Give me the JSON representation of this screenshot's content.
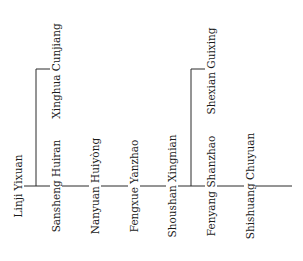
{
  "diagram": {
    "type": "lineage-tree",
    "line_color": "#2b2b2b",
    "text_color": "#1a1a1a",
    "nodes": [
      {
        "id": "linji",
        "label": "Linji Yixuan",
        "role": "root"
      },
      {
        "id": "xinghua",
        "label": "Xinghua Cunjiang",
        "role": "branch"
      },
      {
        "id": "sansheng",
        "label": "Sansheng Huiran",
        "role": "trunk"
      },
      {
        "id": "nanyuan",
        "label": "Nanyuan Huiyòng",
        "role": "trunk"
      },
      {
        "id": "fengxue",
        "label": "Fengxue Yanzhao",
        "role": "trunk"
      },
      {
        "id": "shoushan",
        "label": "Shoushan Xingnian",
        "role": "trunk"
      },
      {
        "id": "shexian",
        "label": "Shexian Guixing",
        "role": "branch"
      },
      {
        "id": "fenyang",
        "label": "Fenyang Shanzhao",
        "role": "trunk"
      },
      {
        "id": "shishuang",
        "label": "Shishuang Chuyuan",
        "role": "trunk"
      }
    ],
    "edges": [
      {
        "from": "linji",
        "to": "xinghua"
      },
      {
        "from": "linji",
        "to": "sansheng"
      },
      {
        "from": "sansheng",
        "to": "nanyuan"
      },
      {
        "from": "nanyuan",
        "to": "fengxue"
      },
      {
        "from": "fengxue",
        "to": "shoushan"
      },
      {
        "from": "shoushan",
        "to": "shexian"
      },
      {
        "from": "shoushan",
        "to": "fenyang"
      },
      {
        "from": "fenyang",
        "to": "shishuang"
      }
    ]
  }
}
